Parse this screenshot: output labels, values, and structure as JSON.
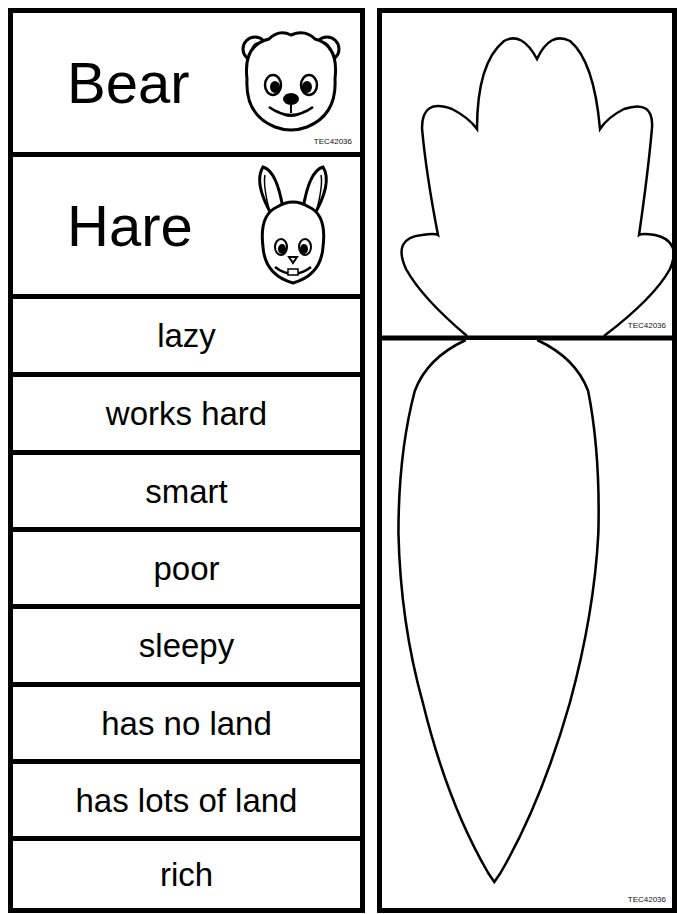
{
  "code": "TEC42036",
  "title_cards": [
    {
      "label": "Bear",
      "icon": "bear-face"
    },
    {
      "label": "Hare",
      "icon": "hare-face"
    }
  ],
  "trait_cards": [
    {
      "label": "lazy"
    },
    {
      "label": "works hard"
    },
    {
      "label": "smart"
    },
    {
      "label": "poor"
    },
    {
      "label": "sleepy"
    },
    {
      "label": "has no land"
    },
    {
      "label": "has lots of land"
    },
    {
      "label": "rich"
    }
  ],
  "carrot": {
    "top_piece": "carrot-leaves",
    "bottom_piece": "carrot-root"
  }
}
